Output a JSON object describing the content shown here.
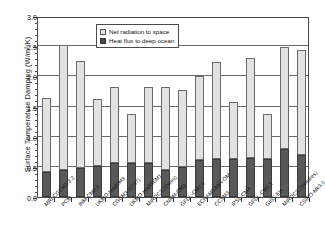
{
  "chart_data": {
    "type": "bar",
    "title": "",
    "subtitle": "",
    "xlabel": "",
    "ylabel": "Surface Temperature Damping (W/m²/K)",
    "ylim": [
      0.0,
      3.0
    ],
    "ytick_labels": [
      "0.0",
      "0.5",
      "1.0",
      "1.5",
      "2.0",
      "2.5",
      "3.0"
    ],
    "ytick_values": [
      0.0,
      0.5,
      1.0,
      1.5,
      2.0,
      2.5,
      3.0
    ],
    "grid": "horizontal",
    "stacked": true,
    "legend_position": "upper-center",
    "categories": [
      "MRI-CGCM2.3.2",
      "PCM",
      "INM-CM3.0",
      "UKMO-HadCM3",
      "CGCM3.1(T47)",
      "UKMO-HadGEM1",
      "MIROC3.2(hires)",
      "CNRM-CM3",
      "GFDL-CM2.0",
      "ECHAM5/MPI-OM",
      "CCSM3",
      "IPSL-CM4",
      "GFDL-CM2.1",
      "GISS-EH",
      "MIROC3.2(medres)",
      "CSIRO-Mk3.0"
    ],
    "series": [
      {
        "name": "Heat flux to deep ocean",
        "color": "#595959",
        "values": [
          0.42,
          0.45,
          0.48,
          0.52,
          0.56,
          0.57,
          0.57,
          0.44,
          0.5,
          0.62,
          0.63,
          0.63,
          0.64,
          0.63,
          0.79,
          0.69
        ]
      },
      {
        "name": "Net radiation to space",
        "color": "#e2e2e2",
        "values": [
          1.22,
          2.07,
          1.77,
          1.1,
          1.26,
          0.81,
          1.25,
          1.39,
          1.27,
          1.38,
          1.61,
          0.94,
          1.66,
          0.74,
          1.7,
          1.74
        ]
      }
    ],
    "totals": [
      1.64,
      2.52,
      2.25,
      1.62,
      1.82,
      1.38,
      1.82,
      1.83,
      1.77,
      2.0,
      2.24,
      1.57,
      2.3,
      1.37,
      2.49,
      2.43
    ]
  },
  "legend": {
    "items": [
      {
        "label": "Net radiation to space",
        "swatch": "light-swatch"
      },
      {
        "label": "Heat flux to deep ocean",
        "swatch": "dark-swatch"
      }
    ]
  }
}
